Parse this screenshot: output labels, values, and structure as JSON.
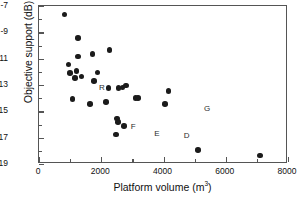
{
  "chart_data": {
    "type": "scatter",
    "title": "",
    "xlabel": "Platform volume (m3)",
    "xlabel_base": "Platform volume (m",
    "xlabel_sup": "3",
    "xlabel_tail": ")",
    "ylabel": "Objective support (dB)",
    "xlim": [
      0,
      8000
    ],
    "ylim": [
      -19,
      -7
    ],
    "grid": false,
    "legend": "none",
    "marker": "filled-circle",
    "marker_color": "#1b1b1b",
    "xticks": [
      0,
      2000,
      4000,
      6000,
      8000
    ],
    "xtick_labels": [
      "0",
      "2000",
      "4000",
      "6000",
      "8000"
    ],
    "xminor_ticks": [
      1000,
      3000,
      5000,
      7000
    ],
    "yticks": [
      -7,
      -9,
      -11,
      -13,
      -15,
      -17,
      -19
    ],
    "ytick_labels": [
      "-7",
      "-9",
      "-11",
      "-13",
      "-15",
      "-17",
      "-19"
    ],
    "yminor_ticks": [
      -8,
      -10,
      -12,
      -14,
      -16,
      -18
    ],
    "points": [
      {
        "x": 820,
        "y": -7.65,
        "label": ""
      },
      {
        "x": 1260,
        "y": -9.45,
        "label": ""
      },
      {
        "x": 1250,
        "y": -10.85,
        "label": ""
      },
      {
        "x": 1720,
        "y": -10.65,
        "label": ""
      },
      {
        "x": 2270,
        "y": -10.35,
        "label": ""
      },
      {
        "x": 950,
        "y": -11.45,
        "label": ""
      },
      {
        "x": 1210,
        "y": -11.95,
        "label": ""
      },
      {
        "x": 1000,
        "y": -12.1,
        "label": ""
      },
      {
        "x": 1370,
        "y": -12.35,
        "label": ""
      },
      {
        "x": 1880,
        "y": -12.05,
        "label": ""
      },
      {
        "x": 1150,
        "y": -12.45,
        "label": ""
      },
      {
        "x": 1760,
        "y": -12.7,
        "label": ""
      },
      {
        "x": 2790,
        "y": -13.05,
        "label": ""
      },
      {
        "x": 2230,
        "y": -13.25,
        "label": ""
      },
      {
        "x": 2550,
        "y": -13.25,
        "label": ""
      },
      {
        "x": 2680,
        "y": -13.2,
        "label": ""
      },
      {
        "x": 4160,
        "y": -13.45,
        "label": ""
      },
      {
        "x": 1080,
        "y": -14.05,
        "label": ""
      },
      {
        "x": 3100,
        "y": -14.0,
        "label": ""
      },
      {
        "x": 3190,
        "y": -14.0,
        "label": ""
      },
      {
        "x": 1640,
        "y": -14.45,
        "label": ""
      },
      {
        "x": 2150,
        "y": -14.3,
        "label": ""
      },
      {
        "x": 4050,
        "y": -14.45,
        "label": ""
      },
      {
        "x": 2500,
        "y": -15.55,
        "label": ""
      },
      {
        "x": 2530,
        "y": -15.8,
        "label": ""
      },
      {
        "x": 2740,
        "y": -16.1,
        "label": ""
      },
      {
        "x": 2480,
        "y": -16.75,
        "label": ""
      },
      {
        "x": 5100,
        "y": -17.95,
        "label": ""
      },
      {
        "x": 7100,
        "y": -18.35,
        "label": ""
      }
    ],
    "annotations": [
      {
        "text": "R",
        "x": 1930,
        "y": -13.25
      },
      {
        "text": "F",
        "x": 2950,
        "y": -16.2
      },
      {
        "text": "E",
        "x": 3700,
        "y": -16.75
      },
      {
        "text": "D",
        "x": 4650,
        "y": -16.9
      },
      {
        "text": "G",
        "x": 5300,
        "y": -14.85
      }
    ]
  }
}
